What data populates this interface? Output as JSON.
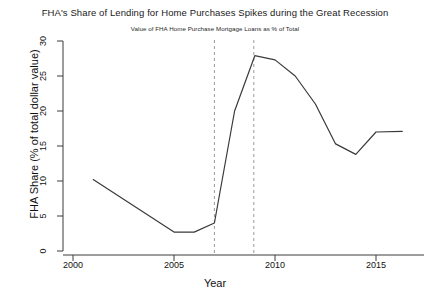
{
  "chart_data": {
    "type": "line",
    "title": "FHA's Share of Lending for Home Purchases Spikes during the Great Recession",
    "subtitle": "Value of FHA Home Purchase Mortgage Loans as % of Total",
    "xlabel": "Year",
    "ylabel": "FHA Share (% of total dollar value)",
    "xlim": [
      2000,
      2016.6
    ],
    "ylim": [
      0,
      30
    ],
    "grid": false,
    "legend": "none",
    "xticks": [
      2000,
      2005,
      2010,
      2015
    ],
    "xtick_labels": [
      "2000",
      "2005",
      "2010",
      "2015"
    ],
    "yticks": [
      0,
      5,
      10,
      15,
      20,
      25,
      30
    ],
    "ytick_labels": [
      "0",
      "5",
      "10",
      "15",
      "20",
      "25",
      "30"
    ],
    "series": [
      {
        "name": "FHA share of home purchase lending",
        "color": "#3a3a3a",
        "x": [
          2001.0,
          2005.0,
          2006.0,
          2007.0,
          2008.0,
          2009.0,
          2010.0,
          2011.0,
          2012.0,
          2013.0,
          2014.0,
          2015.0,
          2016.3
        ],
        "values": [
          10.2,
          2.7,
          2.7,
          4.0,
          20.0,
          27.9,
          27.3,
          25.0,
          21.0,
          15.3,
          13.8,
          17.0,
          17.1
        ]
      }
    ],
    "annotations": [
      {
        "type": "vline",
        "x": 2007.0,
        "style": "dashed",
        "color": "#9a9a9a"
      },
      {
        "type": "vline",
        "x": 2008.95,
        "style": "dashed",
        "color": "#9a9a9a"
      }
    ]
  }
}
